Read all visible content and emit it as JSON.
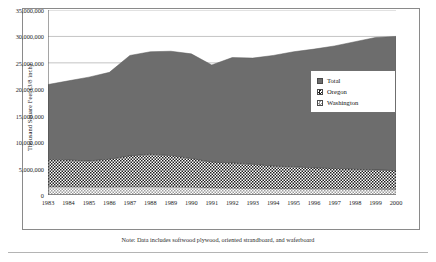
{
  "chart_data": {
    "type": "area",
    "stacked": true,
    "title": "",
    "xlabel": "",
    "ylabel": "Thousand Square Feet (3/8 inch)",
    "ylim": [
      0,
      35000000
    ],
    "ytick_labels": [
      "35,000,000",
      "30,000,000",
      "25,000,000",
      "20,000,000",
      "15,000,000",
      "10,000,000",
      "5,000,000",
      "0"
    ],
    "ytick_values": [
      35000000,
      30000000,
      25000000,
      20000000,
      15000000,
      10000000,
      5000000,
      0
    ],
    "grid": true,
    "grid_axis": "y",
    "legend_position": "center-right",
    "categories": [
      "1983",
      "1984",
      "1985",
      "1986",
      "1987",
      "1988",
      "1989",
      "1990",
      "1991",
      "1992",
      "1993",
      "1994",
      "1995",
      "1996",
      "1997",
      "1998",
      "1999",
      "2000"
    ],
    "x": [
      1983,
      1984,
      1985,
      1986,
      1987,
      1988,
      1989,
      1990,
      1991,
      1992,
      1993,
      1994,
      1995,
      1996,
      1997,
      1998,
      1999,
      2000
    ],
    "series": [
      {
        "name": "Washington",
        "color": "#a8a8a8",
        "pattern": "light-checker",
        "values": [
          1500000,
          1500000,
          1450000,
          1450000,
          1500000,
          1500000,
          1450000,
          1400000,
          1300000,
          1250000,
          1200000,
          1150000,
          1150000,
          1100000,
          1100000,
          1050000,
          1050000,
          1000000
        ]
      },
      {
        "name": "Oregon",
        "color": "#2b2b2b",
        "pattern": "dark-checker",
        "values": [
          5200000,
          5100000,
          5000000,
          5300000,
          5900000,
          6200000,
          6000000,
          5500000,
          4900000,
          4800000,
          4600000,
          4300000,
          4200000,
          4000000,
          3900000,
          3800000,
          3700000,
          3600000
        ]
      },
      {
        "name": "Total",
        "color": "#6d6d6d",
        "pattern": "solid-gray",
        "values": [
          20900000,
          21600000,
          22300000,
          23200000,
          26400000,
          27100000,
          27200000,
          26700000,
          24600000,
          26000000,
          25900000,
          26400000,
          27100000,
          27600000,
          28200000,
          29000000,
          29800000,
          30000000
        ]
      }
    ],
    "legend_entries": [
      "Total",
      "Oregon",
      "Washington"
    ],
    "note": "Note:  Data includes softwood plywood, oriented strandboard, and waferboard"
  },
  "legend": {
    "items": [
      {
        "label": "Total",
        "swatch": "legend-swatch-total"
      },
      {
        "label": "Oregon",
        "swatch": "legend-swatch-oregon"
      },
      {
        "label": "Washington",
        "swatch": "legend-swatch-washington"
      }
    ]
  }
}
